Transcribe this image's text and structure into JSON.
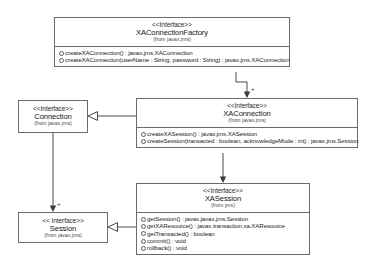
{
  "diagram": {
    "type": "uml-class-diagram",
    "classes": [
      {
        "id": "xaconnectionfactory",
        "stereotype": "<<Interface>>",
        "name": "XAConnectionFactory",
        "package": "(from javax.jms)",
        "operations": [
          {
            "visibility": "public",
            "text": "createXAConnection() : javax.jms.XAConnection"
          },
          {
            "visibility": "public",
            "text": "createXAConnection(userName : String, password : String) : javax.jms.XAConnection"
          }
        ]
      },
      {
        "id": "xaconnection",
        "stereotype": "<<Interface>>",
        "name": "XAConnection",
        "package": "(from javax.jms)",
        "operations": [
          {
            "visibility": "public",
            "text": "createXASession() : javax.jms.XASession"
          },
          {
            "visibility": "public",
            "text": "createSession(transacted : boolean, acknowledgeMode : int) : javax.jms.Session"
          }
        ]
      },
      {
        "id": "connection",
        "stereotype": "<<Interface>>",
        "name": "Connection",
        "package": "(from javax.jms)",
        "operations": []
      },
      {
        "id": "xasession",
        "stereotype": "<<Interface>>",
        "name": "XASession",
        "package": "(from jms)",
        "operations": [
          {
            "visibility": "public",
            "text": "getSession() : javax.javax.jms.Session"
          },
          {
            "visibility": "public",
            "text": "getXAResource() : javax.transaction.xa.XAResource"
          },
          {
            "visibility": "public",
            "text": "getTransacted() : boolean"
          },
          {
            "visibility": "public",
            "text": "commit() : void"
          },
          {
            "visibility": "public",
            "text": "rollback() : void"
          }
        ]
      },
      {
        "id": "session",
        "stereotype": "<< Interface>>",
        "name": "Session",
        "package": "(from javax.jms)",
        "operations": []
      }
    ],
    "relationships": [
      {
        "id": "factory-creates-xaconnection",
        "kind": "dependency",
        "from": "xaconnectionfactory",
        "to": "xaconnection",
        "multiplicity": "+"
      },
      {
        "id": "xaconnection-extends-connection",
        "kind": "generalization",
        "from": "xaconnection",
        "to": "connection",
        "multiplicity": ""
      },
      {
        "id": "connection-creates-session",
        "kind": "dependency",
        "from": "connection",
        "to": "session",
        "multiplicity": "+"
      },
      {
        "id": "xasession-extends-session",
        "kind": "generalization",
        "from": "xasession",
        "to": "session",
        "multiplicity": ""
      },
      {
        "id": "xaconnection-to-xasession",
        "kind": "association",
        "from": "xaconnection",
        "to": "xasession",
        "multiplicity": ""
      }
    ],
    "colors": {
      "line": "#6b6b6b",
      "text": "#151515",
      "background": "#ffffff"
    }
  }
}
